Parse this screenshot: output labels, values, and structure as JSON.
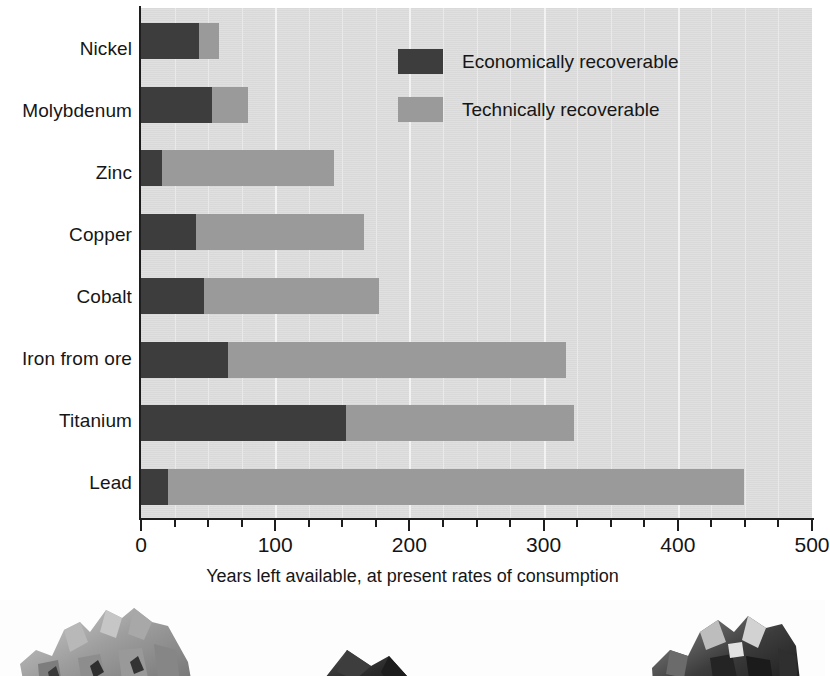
{
  "chart_data": {
    "type": "bar",
    "orientation": "horizontal",
    "stacked": true,
    "title": "",
    "subtitle": "",
    "xlabel": "Years left available, at present rates of consumption",
    "ylabel": "",
    "xlim": [
      0,
      500
    ],
    "xticks": [
      0,
      100,
      200,
      300,
      400,
      500
    ],
    "xtick_labels": [
      "0",
      "100",
      "200",
      "300",
      "400",
      "500"
    ],
    "minor_tick_step": 25,
    "grid": "vertical-white-gridlines",
    "legend_position": "inside-top-right",
    "categories": [
      "Nickel",
      "Molybdenum",
      "Zinc",
      "Copper",
      "Cobalt",
      "Iron from ore",
      "Titanium",
      "Lead"
    ],
    "series": [
      {
        "name": "Economically recoverable",
        "color": "#3d3d3d",
        "values": [
          43,
          53,
          16,
          41,
          47,
          65,
          153,
          20
        ]
      },
      {
        "name": "Technically recoverable",
        "color": "#9a9a9a",
        "values": [
          15,
          27,
          128,
          125,
          130,
          252,
          170,
          429
        ]
      }
    ],
    "totals": [
      58,
      80,
      144,
      166,
      177,
      317,
      323,
      449
    ]
  },
  "legend": {
    "items": [
      {
        "label": "Economically recoverable",
        "color": "#3d3d3d",
        "swatch": "legend-swatch-dark"
      },
      {
        "label": "Technically recoverable",
        "color": "#9a9a9a",
        "swatch": "legend-swatch-light"
      }
    ]
  },
  "axis": {
    "x_title": "Years left available, at present rates of consumption",
    "tick_labels": [
      "0",
      "100",
      "200",
      "300",
      "400",
      "500"
    ]
  },
  "photo_strip": {
    "caption": "",
    "items": [
      {
        "name": "ore-sample-left",
        "alt": "metallic ore rock specimen"
      },
      {
        "name": "ore-sample-center",
        "alt": "dark mineral fragment"
      },
      {
        "name": "ore-sample-right",
        "alt": "dark crystalline ore chunk"
      }
    ]
  },
  "colors": {
    "plot_background": "#dcdcdc",
    "gridline": "#f2f2f2",
    "axis": "#1e1e1e",
    "economically_recoverable": "#3d3d3d",
    "technically_recoverable": "#9a9a9a",
    "page_background": "#ffffff"
  }
}
